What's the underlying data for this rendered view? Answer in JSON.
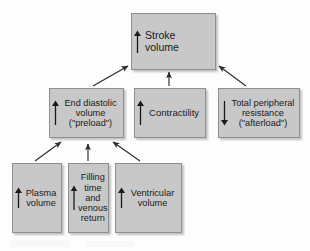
{
  "diagram": {
    "background_color": "#fdfdfd",
    "node_fill_color": "#c8c8c8",
    "node_border_color": "#8e8e8e",
    "edge_color": "#2b2b2b",
    "nodes": [
      {
        "id": "stroke-volume",
        "label": "Stroke volume",
        "direction": "up",
        "direction_symbol": "↑"
      },
      {
        "id": "end-diastolic-volume",
        "label": "End diastolic\nvolume\n(\"preload\")",
        "direction": "up",
        "direction_symbol": "↑"
      },
      {
        "id": "contractility",
        "label": "Contractility",
        "direction": "up",
        "direction_symbol": "↑"
      },
      {
        "id": "total-peripheral-resistance",
        "label": "Total peripheral\nresistance\n(\"afterload\")",
        "direction": "down",
        "direction_symbol": "↓"
      },
      {
        "id": "plasma-volume",
        "label": "Plasma\nvolume",
        "direction": "up",
        "direction_symbol": "↑"
      },
      {
        "id": "filling-time-venous-return",
        "label": "Filling\ntime\nand\nvenous\nreturn",
        "direction": "up",
        "direction_symbol": "↑"
      },
      {
        "id": "ventricular-volume",
        "label": "Ventricular\nvolume",
        "direction": "up",
        "direction_symbol": "↑"
      }
    ],
    "edges": [
      {
        "from": "end-diastolic-volume",
        "to": "stroke-volume",
        "style": "diagonal-up-right"
      },
      {
        "from": "contractility",
        "to": "stroke-volume",
        "style": "vertical-up"
      },
      {
        "from": "total-peripheral-resistance",
        "to": "stroke-volume",
        "style": "diagonal-up-left"
      },
      {
        "from": "plasma-volume",
        "to": "end-diastolic-volume",
        "style": "diagonal-up-right"
      },
      {
        "from": "filling-time-venous-return",
        "to": "end-diastolic-volume",
        "style": "vertical-up"
      },
      {
        "from": "ventricular-volume",
        "to": "end-diastolic-volume",
        "style": "diagonal-up-left"
      }
    ]
  }
}
